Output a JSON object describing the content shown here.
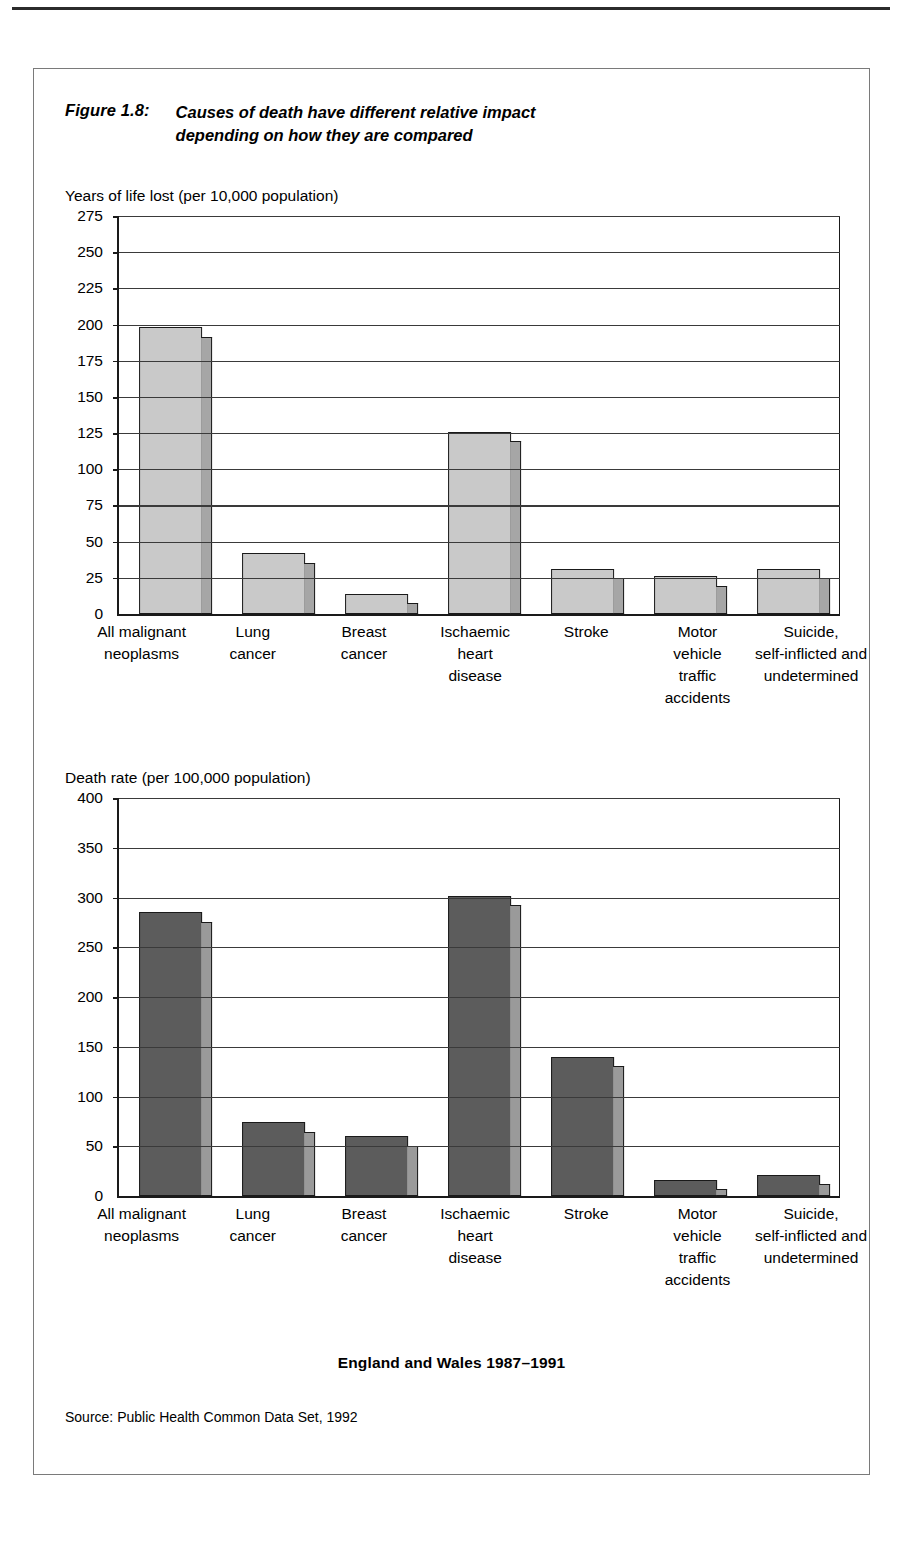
{
  "figure": {
    "number": "Figure 1.8:",
    "title_line1": "Causes of death have different relative impact",
    "title_line2": "depending on how they are compared",
    "footer_title": "England and Wales 1987–1991",
    "source": "Source: Public Health Common Data Set, 1992"
  },
  "colors": {
    "chart1_bar": "#c9c9c9",
    "chart1_shadow": "#a6a6a6",
    "chart2_bar": "#5c5c5c",
    "chart2_shadow": "#9a9a9a",
    "axis": "#1a1a1a",
    "frame": "#7a7a7a"
  },
  "chart_data": [
    {
      "type": "bar",
      "title": "Years of  life lost (per 10,000 population)",
      "xlabel": "",
      "ylabel": "Years of life lost (per 10,000 population)",
      "ylim": [
        0,
        275
      ],
      "yticks": [
        0,
        25,
        50,
        75,
        100,
        125,
        150,
        175,
        200,
        225,
        250,
        275
      ],
      "ytick_labels": [
        "0",
        "25",
        "50",
        "75",
        "100",
        "125",
        "150",
        "175",
        "200",
        "225",
        "250",
        "275"
      ],
      "grid": true,
      "legend": "none",
      "categories": [
        [
          "All malignant",
          "neoplasms"
        ],
        [
          "Lung",
          "cancer"
        ],
        [
          "Breast",
          "cancer"
        ],
        [
          "Ischaemic",
          "heart",
          "disease"
        ],
        [
          "Stroke"
        ],
        [
          "Motor",
          "vehicle",
          "traffic",
          "accidents"
        ],
        [
          "Suicide,",
          "self-inflicted and",
          "undetermined"
        ]
      ],
      "values": [
        198,
        42,
        14,
        126,
        31,
        26,
        31
      ]
    },
    {
      "type": "bar",
      "title": "Death rate (per 100,000 population)",
      "xlabel": "",
      "ylabel": "Death rate (per 100,000 population)",
      "ylim": [
        0,
        400
      ],
      "yticks": [
        0,
        50,
        100,
        150,
        200,
        250,
        300,
        350,
        400
      ],
      "ytick_labels": [
        "0",
        "50",
        "100",
        "150",
        "200",
        "250",
        "300",
        "350",
        "400"
      ],
      "grid": true,
      "legend": "none",
      "categories": [
        [
          "All malignant",
          "neoplasms"
        ],
        [
          "Lung",
          "cancer"
        ],
        [
          "Breast",
          "cancer"
        ],
        [
          "Ischaemic",
          "heart",
          "disease"
        ],
        [
          "Stroke"
        ],
        [
          "Motor",
          "vehicle",
          "traffic",
          "accidents"
        ],
        [
          "Suicide,",
          "self-inflicted and",
          "undetermined"
        ]
      ],
      "values": [
        285,
        74,
        60,
        302,
        140,
        16,
        21
      ]
    }
  ]
}
